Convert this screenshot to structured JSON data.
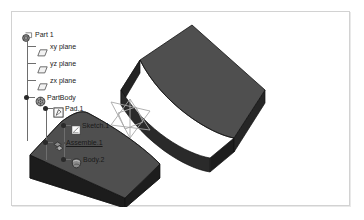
{
  "app": {
    "title": "CAD Specification Tree",
    "background": "#ffffff",
    "frame_border_color": "#d2d2d2"
  },
  "tree": {
    "root": {
      "label": "Part 1",
      "icon": "part-icon"
    },
    "items": [
      {
        "label": "xy plane",
        "icon": "plane-icon",
        "depth": 1,
        "underlined": false
      },
      {
        "label": "yz plane",
        "icon": "plane-icon",
        "depth": 1,
        "underlined": false
      },
      {
        "label": "zx plane",
        "icon": "plane-icon",
        "depth": 1,
        "underlined": false
      },
      {
        "label": "PartBody",
        "icon": "partbody-icon",
        "depth": 1,
        "underlined": false
      },
      {
        "label": "Pad.1",
        "icon": "pad-icon",
        "depth": 2,
        "underlined": false
      },
      {
        "label": "Sketch.1",
        "icon": "sketch-icon",
        "depth": 3,
        "underlined": false
      },
      {
        "label": "Assemble.1",
        "icon": "assemble-icon",
        "depth": 2,
        "underlined": true
      },
      {
        "label": "Body.2",
        "icon": "body-icon",
        "depth": 3,
        "underlined": false
      }
    ]
  },
  "viewport": {
    "compass_label": "3d-compass",
    "solids": [
      {
        "name": "upper-solid-concave-block",
        "top_face_color": "#4f4f4f",
        "front_face_color": "#1e1e1e",
        "side_face_color": "#2b2b2b",
        "edge_color": "#141414"
      },
      {
        "name": "lower-solid-concave-block",
        "top_face_color": "#4f4f4f",
        "front_face_color": "#1e1e1e",
        "side_face_color": "#2b2b2b",
        "edge_color": "#141414"
      }
    ],
    "compass_color": "#a8a8a8"
  }
}
